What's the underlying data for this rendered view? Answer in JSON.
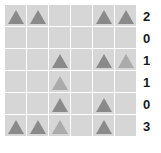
{
  "grid": {
    "rows": 6,
    "cols": 6,
    "cell_size_px": 21,
    "gap_px": 1,
    "cell_color": "#d6d6d6",
    "gridline_color": "#ffffff",
    "shape": "triangle"
  },
  "colors": {
    "triangle_dark": "#8a8a8a",
    "triangle_light": "#ababab",
    "cell_background": "#d6d6d6",
    "gridline": "#ffffff",
    "label_text": "#1a1a1a",
    "page_background": "#ffffff"
  },
  "chart_data": {
    "type": "heatmap",
    "xlabel": "",
    "ylabel": "",
    "rows": 6,
    "cols": 6,
    "legend": [],
    "grid": true,
    "cells": [
      [
        1,
        1,
        0,
        0,
        1,
        1
      ],
      [
        0,
        0,
        0,
        0,
        0,
        0
      ],
      [
        0,
        0,
        1,
        0,
        1,
        1
      ],
      [
        0,
        0,
        1,
        0,
        0,
        0
      ],
      [
        0,
        0,
        1,
        0,
        1,
        0
      ],
      [
        1,
        1,
        1,
        0,
        1,
        0
      ]
    ],
    "cell_shades": [
      [
        "dark",
        "dark",
        "none",
        "none",
        "dark",
        "dark"
      ],
      [
        "none",
        "none",
        "none",
        "none",
        "none",
        "none"
      ],
      [
        "none",
        "none",
        "dark",
        "none",
        "dark",
        "light"
      ],
      [
        "none",
        "none",
        "light",
        "none",
        "none",
        "none"
      ],
      [
        "none",
        "none",
        "dark",
        "none",
        "dark",
        "none"
      ],
      [
        "dark",
        "dark",
        "light",
        "none",
        "dark",
        "none"
      ]
    ],
    "row_labels": [
      "2",
      "0",
      "1",
      "1",
      "0",
      "3"
    ],
    "row_label_values": [
      2,
      0,
      1,
      1,
      0,
      3
    ],
    "triangles_per_row": [
      4,
      0,
      3,
      1,
      2,
      4
    ],
    "total_triangles": 14
  }
}
